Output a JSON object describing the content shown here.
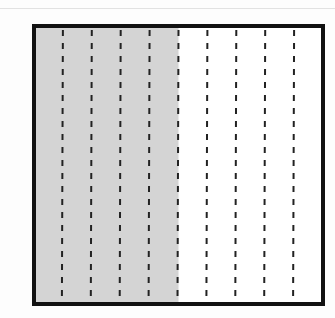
{
  "diagram": {
    "type": "fraction-model",
    "total_parts": 10,
    "shaded_parts": 5,
    "fraction_shaded": "5/10",
    "colors": {
      "border": "#111111",
      "shaded": "#d4d4d4",
      "unshaded": "#ffffff",
      "divider": "#222222"
    }
  }
}
